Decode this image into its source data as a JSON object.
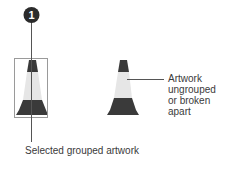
{
  "callout": {
    "number": "1",
    "badge_color": "#2b2b2b",
    "number_color": "#ffffff"
  },
  "labels": {
    "selected": "Selected grouped artwork",
    "ungrouped": "Artwork ungrouped or broken apart"
  },
  "colors": {
    "cone_dark": "#3a3a3a",
    "cone_stripe": "#e2e2e2",
    "selection_box": "#9a9a9a",
    "leader_line": "#555555"
  }
}
